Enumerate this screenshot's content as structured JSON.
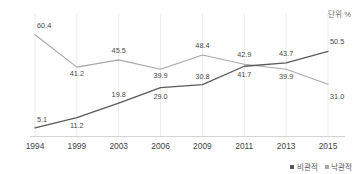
{
  "unit_label": "단위 %",
  "legend": {
    "position": "bottom-right",
    "items": [
      {
        "label": "비관적",
        "color": "#595959"
      },
      {
        "label": "낙관적",
        "color": "#a8a8a8"
      }
    ]
  },
  "chart_data": {
    "type": "line",
    "title": "",
    "subtitle": "",
    "xlabel": "",
    "ylabel": "",
    "unit": "%",
    "grid": "vertical",
    "legend_position": "bottom-right",
    "ylim": [
      0,
      65
    ],
    "categories": [
      "1994",
      "1999",
      "2003",
      "2006",
      "2009",
      "2011",
      "2013",
      "2015"
    ],
    "series": [
      {
        "name": "비관적",
        "color": "#595959",
        "values": [
          5.1,
          11.2,
          19.8,
          29.0,
          30.8,
          41.7,
          43.7,
          50.5
        ],
        "labels": [
          "5.1",
          "11.2",
          "19.8",
          "29.0",
          "30.8",
          "41.7",
          "43.7",
          "50.5"
        ]
      },
      {
        "name": "낙관적",
        "color": "#a8a8a8",
        "values": [
          60.4,
          41.2,
          45.5,
          39.9,
          48.4,
          42.9,
          39.9,
          31.0
        ],
        "labels": [
          "60.4",
          "41.2",
          "45.5",
          "39.9",
          "48.4",
          "42.9",
          "39.9",
          "31.0"
        ]
      }
    ]
  }
}
